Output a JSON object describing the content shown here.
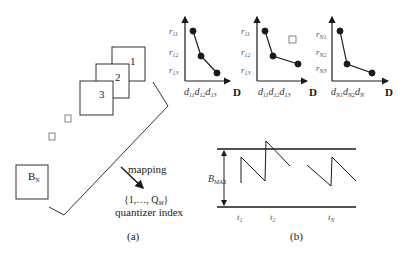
{
  "panel_a": {
    "frames": [
      {
        "label": "1"
      },
      {
        "label": "2"
      },
      {
        "label": "3"
      }
    ],
    "last_frame": {
      "label": "B",
      "sub": "N"
    },
    "mapping_label": "mapping",
    "index_set": {
      "prefix": "{1,…, Q",
      "sub": "M",
      "suffix": "}"
    },
    "index_caption": "quantizer index",
    "caption": "(a)"
  },
  "charts": [
    {
      "y_ticks": [
        {
          "base": "r",
          "sub": "11"
        },
        {
          "base": "r",
          "sub": "12"
        },
        {
          "base": "r",
          "sub": "13"
        }
      ],
      "x_ticks": [
        {
          "base": "d",
          "sub": "11"
        },
        {
          "base": "d",
          "sub": "12"
        },
        {
          "base": "d",
          "sub": "13"
        }
      ],
      "x_axis": "D"
    },
    {
      "y_ticks": [
        {
          "base": "r",
          "sub": "11"
        },
        {
          "base": "r",
          "sub": "12"
        },
        {
          "base": "r",
          "sub": "13"
        }
      ],
      "x_ticks": [
        {
          "base": "d",
          "sub": "11"
        },
        {
          "base": "d",
          "sub": "12"
        },
        {
          "base": "d",
          "sub": "13"
        }
      ],
      "x_axis": "D"
    },
    {
      "y_ticks": [
        {
          "base": "r",
          "sub": "N1"
        },
        {
          "base": "r",
          "sub": "N2"
        },
        {
          "base": "r",
          "sub": "N3"
        }
      ],
      "x_ticks": [
        {
          "base": "d",
          "sub": "N1"
        },
        {
          "base": "d",
          "sub": "N2"
        },
        {
          "base": "d",
          "sub": "N"
        }
      ],
      "x_axis": "D"
    }
  ],
  "panel_b": {
    "buffer_label": {
      "base": "B",
      "sub": "MAX"
    },
    "time_labels": [
      {
        "base": "t",
        "sub": "1"
      },
      {
        "base": "t",
        "sub": "2"
      },
      {
        "base": "t",
        "sub": "N"
      }
    ],
    "caption": "(b)"
  }
}
